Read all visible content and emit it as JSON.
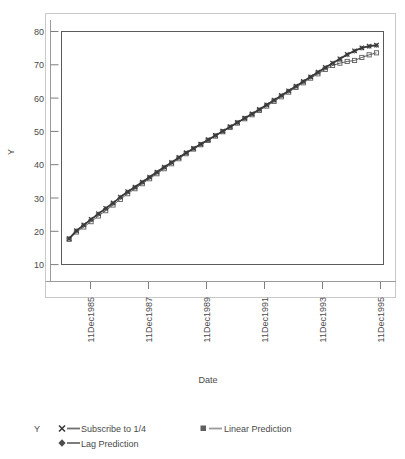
{
  "chart_data": {
    "type": "line",
    "title": "",
    "subtitle": "",
    "xlabel": "Date",
    "ylabel": "Y",
    "legend_title": "Y",
    "legend_position": "bottom-left",
    "grid": false,
    "ylim": [
      10,
      80
    ],
    "yticks": [
      10,
      20,
      30,
      40,
      50,
      60,
      70,
      80
    ],
    "ytick_labels": [
      "10",
      "20",
      "30",
      "40",
      "50",
      "60",
      "70",
      "80"
    ],
    "xticks": [
      "11Dec1985",
      "11Dec1987",
      "11Dec1989",
      "11Dec1991",
      "11Dec1993",
      "11Dec1995"
    ],
    "xtick_labels": [
      "11Dec1985",
      "11Dec1987",
      "11Dec1989",
      "11Dec1991",
      "11Dec1993",
      "11Dec1995"
    ],
    "xlim": [
      "11Jun1985",
      "11Jun1996"
    ],
    "x_rotation": 90,
    "colors": {
      "subscribe": "#3a3a3a",
      "linear": "#5e5e5e",
      "lag": "#7a7a7a",
      "frame": "#555555",
      "outer_frame": "#c8c8c8",
      "axis": "#8a8a8a",
      "text": "#4a4a4a"
    },
    "series": [
      {
        "name": "Subscribe to 1/4",
        "marker": "cross",
        "color": "#3a3a3a",
        "x": [
          "1985.46",
          "1985.71",
          "1985.96",
          "1986.21",
          "1986.46",
          "1986.71",
          "1986.96",
          "1987.21",
          "1987.46",
          "1987.71",
          "1987.96",
          "1988.21",
          "1988.46",
          "1988.71",
          "1988.96",
          "1989.21",
          "1989.46",
          "1989.71",
          "1989.96",
          "1990.21",
          "1990.46",
          "1990.71",
          "1990.96",
          "1991.21",
          "1991.46",
          "1991.71",
          "1991.96",
          "1992.21",
          "1992.46",
          "1992.71",
          "1992.96",
          "1993.21",
          "1993.46",
          "1993.71",
          "1993.96",
          "1994.21",
          "1994.46",
          "1994.71",
          "1994.96",
          "1995.21",
          "1995.46",
          "1995.71",
          "1995.96"
        ],
        "values": [
          17.8,
          20.2,
          21.9,
          23.6,
          25.3,
          26.9,
          28.5,
          30.3,
          31.9,
          33.3,
          34.8,
          36.3,
          37.8,
          39.3,
          40.7,
          42.2,
          43.6,
          44.9,
          46.2,
          47.5,
          48.8,
          50.1,
          51.4,
          52.7,
          54.0,
          55.3,
          56.6,
          58.0,
          59.4,
          60.8,
          62.2,
          63.6,
          65.0,
          66.4,
          67.8,
          69.2,
          70.5,
          71.8,
          73.1,
          74.2,
          75.1,
          75.6,
          75.9
        ]
      },
      {
        "name": "Linear Prediction",
        "marker": "square",
        "color": "#5e5e5e",
        "x": [
          "1985.46",
          "1985.71",
          "1985.96",
          "1986.21",
          "1986.46",
          "1986.71",
          "1986.96",
          "1987.21",
          "1987.46",
          "1987.71",
          "1987.96",
          "1988.21",
          "1988.46",
          "1988.71",
          "1988.96",
          "1989.21",
          "1989.46",
          "1989.71",
          "1989.96",
          "1990.21",
          "1990.46",
          "1990.71",
          "1990.96",
          "1991.21",
          "1991.46",
          "1991.71",
          "1991.96",
          "1992.21",
          "1992.46",
          "1992.71",
          "1992.96",
          "1993.21",
          "1993.46",
          "1993.71",
          "1993.96",
          "1994.21",
          "1994.46",
          "1994.71",
          "1994.96",
          "1995.21",
          "1995.46",
          "1995.71",
          "1995.96"
        ],
        "values": [
          17.6,
          19.8,
          21.3,
          22.9,
          24.6,
          26.2,
          27.9,
          29.6,
          31.3,
          32.8,
          34.3,
          35.8,
          37.3,
          38.8,
          40.3,
          41.8,
          43.3,
          44.7,
          46.0,
          47.3,
          48.6,
          49.9,
          51.2,
          52.5,
          53.8,
          55.0,
          56.3,
          57.6,
          59.0,
          60.4,
          61.8,
          63.2,
          64.6,
          66.0,
          67.3,
          68.6,
          69.8,
          70.5,
          71.0,
          71.3,
          72.2,
          73.0,
          73.6
        ]
      },
      {
        "name": "Lag Prediction",
        "marker": "diamond",
        "color": "#7a7a7a",
        "x": [
          "1985.46",
          "1985.71",
          "1985.96",
          "1986.21",
          "1986.46",
          "1986.71",
          "1986.96",
          "1987.21",
          "1987.46",
          "1987.71",
          "1987.96",
          "1988.21",
          "1988.46",
          "1988.71",
          "1988.96",
          "1989.21",
          "1989.46",
          "1989.71",
          "1989.96",
          "1990.21",
          "1990.46",
          "1990.71",
          "1990.96",
          "1991.21",
          "1991.46",
          "1991.71",
          "1991.96",
          "1992.21",
          "1992.46",
          "1992.71",
          "1992.96",
          "1993.21",
          "1993.46",
          "1993.71",
          "1993.96",
          "1994.21",
          "1994.46",
          "1994.71",
          "1994.96",
          "1995.21",
          "1995.46",
          "1995.71",
          "1995.96"
        ],
        "values": [
          17.8,
          20.1,
          21.8,
          23.5,
          25.2,
          26.8,
          28.4,
          30.2,
          31.8,
          33.2,
          34.7,
          36.2,
          37.7,
          39.2,
          40.6,
          42.1,
          43.5,
          44.8,
          46.1,
          47.4,
          48.7,
          50.0,
          51.3,
          52.6,
          53.9,
          55.2,
          56.5,
          57.9,
          59.3,
          60.7,
          62.1,
          63.5,
          64.9,
          66.3,
          67.7,
          69.1,
          70.4,
          71.7,
          73.0,
          74.1,
          75.0,
          75.5,
          75.8
        ]
      }
    ]
  },
  "legend": {
    "title": "Y",
    "entries": [
      {
        "label": "Subscribe to 1/4",
        "marker": "cross"
      },
      {
        "label": "Linear Prediction",
        "marker": "square"
      },
      {
        "label": "Lag Prediction",
        "marker": "diamond"
      }
    ]
  }
}
